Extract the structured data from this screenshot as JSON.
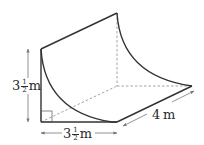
{
  "diagram": {
    "type": "3d-solid-quarter-circle-prism",
    "labels": {
      "height": {
        "whole": "3",
        "num": "1",
        "den": "2",
        "unit": "m"
      },
      "width": {
        "whole": "3",
        "num": "1",
        "den": "2",
        "unit": "m"
      },
      "length": {
        "value": "4",
        "unit": "m"
      }
    },
    "colors": {
      "line": "#333333",
      "arrow": "#777777",
      "hidden": "#999999"
    }
  }
}
